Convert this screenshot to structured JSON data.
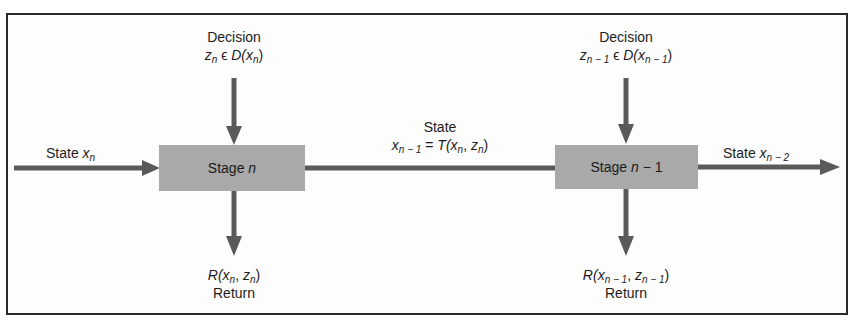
{
  "diagram": {
    "type": "dynamic-programming-stage-flow",
    "colors": {
      "stage_fill": "#a9a9a9",
      "arrow": "#5a5a5a",
      "border": "#2a2a2a",
      "text": "#1c1c1c"
    },
    "stages": [
      {
        "id": "stage-n",
        "label_prefix": "Stage ",
        "label_var": "n",
        "label_suffix": "",
        "decision": {
          "title": "Decision",
          "z": "z",
          "z_sub": "n",
          "in": " ϵ ",
          "D": "D(",
          "x": "x",
          "x_sub": "n",
          "close": ")"
        },
        "return": {
          "R": "R(",
          "x": "x",
          "x_sub": "n",
          "sep": ", ",
          "z": "z",
          "z_sub": "n",
          "close": ")",
          "title": "Return"
        }
      },
      {
        "id": "stage-n-1",
        "label_prefix": "Stage ",
        "label_var": "n",
        "label_suffix": " − 1",
        "decision": {
          "title": "Decision",
          "z": "z",
          "z_sub": "n − 1",
          "in": " ϵ ",
          "D": "D(",
          "x": "x",
          "x_sub": "n − 1",
          "close": ")"
        },
        "return": {
          "R": "R(",
          "x": "x",
          "x_sub": "n − 1",
          "sep": ", ",
          "z": "z",
          "z_sub": "n − 1",
          "close": ")",
          "title": "Return"
        }
      }
    ],
    "state_in": {
      "title": "State ",
      "x": "x",
      "x_sub": "n"
    },
    "state_mid": {
      "title": "State",
      "x": "x",
      "x_sub": "n − 1",
      "eq": " = ",
      "T": "T(",
      "a": "x",
      "a_sub": "n",
      "sep": ", ",
      "b": "z",
      "b_sub": "n",
      "close": ")"
    },
    "state_out": {
      "title": "State ",
      "x": "x",
      "x_sub": "n − 2"
    }
  }
}
